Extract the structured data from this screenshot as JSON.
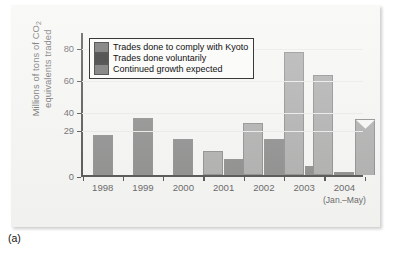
{
  "caption": "(a)",
  "chart_data": {
    "type": "bar",
    "title": "",
    "xlabel": "",
    "ylabel": "Millions of tons of CO2 equivalents traded",
    "ylabel_line1": "Millions of tons of CO",
    "ylabel_sub": "2",
    "ylabel_line2": "equivalents traded",
    "ylim": [
      0,
      90
    ],
    "yticks": [
      0,
      29,
      40,
      60,
      80
    ],
    "ytick_labels": [
      "0",
      "29",
      "40",
      "60",
      "80"
    ],
    "grid": true,
    "legend_position": "top-left",
    "categories": [
      "1998",
      "1999",
      "2000",
      "2001",
      "2002",
      "2003",
      "2004"
    ],
    "category_sublabels": [
      "",
      "",
      "",
      "",
      "",
      "",
      "(Jan.–May)"
    ],
    "series": [
      {
        "name": "Trades done to comply with Kyoto",
        "color": "#8a8a8a",
        "values": [
          null,
          null,
          null,
          15,
          33,
          77,
          63
        ]
      },
      {
        "name": "Trades done voluntarily",
        "color": "#575757",
        "values": [
          25,
          36,
          23,
          10,
          23,
          6,
          2
        ]
      },
      {
        "name": "Continued growth expected",
        "color": "#8a8a8a",
        "values": [
          null,
          null,
          null,
          null,
          null,
          null,
          35
        ]
      }
    ]
  }
}
